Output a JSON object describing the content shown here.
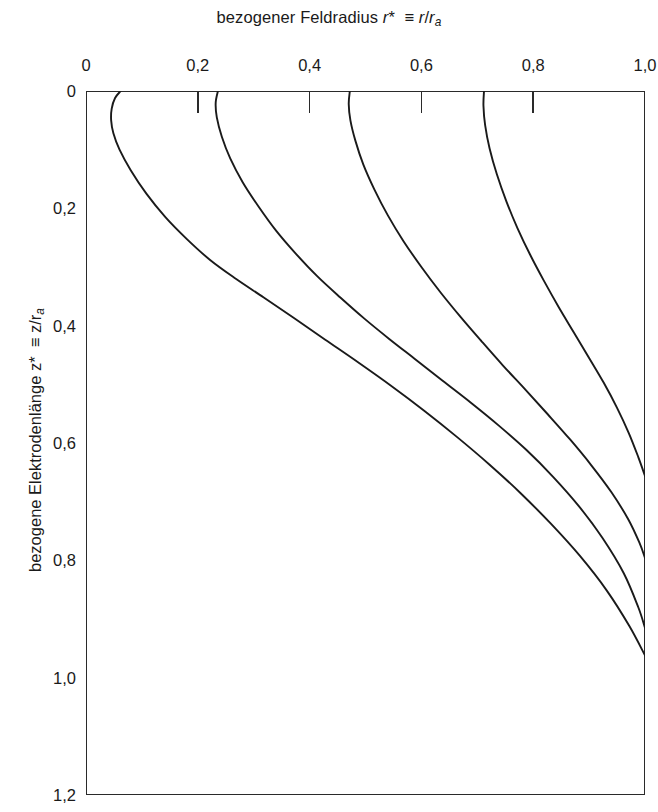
{
  "chart_data": {
    "type": "line",
    "title_plain": "bezogener Feldradius r* ≡ r/ra",
    "title_parts": {
      "text1": "bezogener Feldradius ",
      "sym1": "r",
      "star1": "*",
      "equiv": "≡",
      "sym2": "r",
      "slash": "/",
      "sym3": "r",
      "sub3": "a"
    },
    "ylabel_plain": "bezogene Elektrodenlänge z* ≡ z/ra",
    "ylabel_parts": {
      "text1": "bezogene Elektrodenlänge ",
      "sym1": "z",
      "star1": "*",
      "equiv": "≡",
      "sym2": "z",
      "slash": "/",
      "sym3": "r",
      "sub3": "a"
    },
    "xlabel": "bezogener Feldradius r* ≡ r/ra",
    "ylabel": "bezogene Elektrodenlänge z* ≡ z/ra",
    "xlim": [
      0,
      1.0
    ],
    "ylim": [
      0,
      1.2
    ],
    "y_axis_inverted": true,
    "xticks": [
      0,
      0.2,
      0.4,
      0.6,
      0.8,
      1.0
    ],
    "xtick_labels": [
      "0",
      "0,2",
      "0,4",
      "0,6",
      "0,8",
      "1,0"
    ],
    "yticks": [
      0,
      0.2,
      0.4,
      0.6,
      0.8,
      1.0,
      1.2
    ],
    "ytick_labels": [
      "0",
      "0,2",
      "0,4",
      "0,6",
      "0,8",
      "1,0",
      "1,2"
    ],
    "grid": false,
    "legend": null,
    "line_color": "#1a1a1a",
    "line_width": 1.9,
    "series": [
      {
        "name": "Feldlinie 1",
        "points": [
          [
            0.062,
            0.0
          ],
          [
            0.052,
            0.012
          ],
          [
            0.046,
            0.03
          ],
          [
            0.045,
            0.05
          ],
          [
            0.049,
            0.072
          ],
          [
            0.06,
            0.1
          ],
          [
            0.08,
            0.135
          ],
          [
            0.108,
            0.175
          ],
          [
            0.142,
            0.215
          ],
          [
            0.18,
            0.252
          ],
          [
            0.222,
            0.288
          ],
          [
            0.268,
            0.32
          ],
          [
            0.318,
            0.352
          ],
          [
            0.372,
            0.387
          ],
          [
            0.428,
            0.424
          ],
          [
            0.486,
            0.462
          ],
          [
            0.545,
            0.502
          ],
          [
            0.605,
            0.545
          ],
          [
            0.664,
            0.59
          ],
          [
            0.722,
            0.637
          ],
          [
            0.778,
            0.686
          ],
          [
            0.832,
            0.738
          ],
          [
            0.884,
            0.793
          ],
          [
            0.932,
            0.852
          ],
          [
            0.972,
            0.912
          ],
          [
            1.0,
            0.962
          ]
        ]
      },
      {
        "name": "Feldlinie 2",
        "points": [
          [
            0.236,
            0.0
          ],
          [
            0.232,
            0.02
          ],
          [
            0.234,
            0.045
          ],
          [
            0.243,
            0.078
          ],
          [
            0.258,
            0.115
          ],
          [
            0.28,
            0.155
          ],
          [
            0.308,
            0.196
          ],
          [
            0.34,
            0.238
          ],
          [
            0.376,
            0.278
          ],
          [
            0.414,
            0.316
          ],
          [
            0.455,
            0.352
          ],
          [
            0.498,
            0.388
          ],
          [
            0.543,
            0.423
          ],
          [
            0.59,
            0.458
          ],
          [
            0.638,
            0.494
          ],
          [
            0.688,
            0.531
          ],
          [
            0.738,
            0.57
          ],
          [
            0.788,
            0.612
          ],
          [
            0.836,
            0.658
          ],
          [
            0.882,
            0.708
          ],
          [
            0.924,
            0.762
          ],
          [
            0.962,
            0.822
          ],
          [
            0.988,
            0.88
          ],
          [
            1.0,
            0.915
          ]
        ]
      },
      {
        "name": "Feldlinie 3",
        "points": [
          [
            0.472,
            0.0
          ],
          [
            0.47,
            0.022
          ],
          [
            0.473,
            0.05
          ],
          [
            0.482,
            0.085
          ],
          [
            0.496,
            0.125
          ],
          [
            0.516,
            0.168
          ],
          [
            0.54,
            0.212
          ],
          [
            0.568,
            0.256
          ],
          [
            0.6,
            0.3
          ],
          [
            0.634,
            0.343
          ],
          [
            0.67,
            0.385
          ],
          [
            0.708,
            0.427
          ],
          [
            0.746,
            0.468
          ],
          [
            0.786,
            0.509
          ],
          [
            0.826,
            0.551
          ],
          [
            0.866,
            0.594
          ],
          [
            0.904,
            0.638
          ],
          [
            0.94,
            0.684
          ],
          [
            0.97,
            0.73
          ],
          [
            0.99,
            0.77
          ],
          [
            1.0,
            0.796
          ]
        ]
      },
      {
        "name": "Feldlinie 4",
        "points": [
          [
            0.712,
            0.0
          ],
          [
            0.711,
            0.025
          ],
          [
            0.714,
            0.058
          ],
          [
            0.722,
            0.098
          ],
          [
            0.735,
            0.142
          ],
          [
            0.752,
            0.188
          ],
          [
            0.772,
            0.234
          ],
          [
            0.795,
            0.28
          ],
          [
            0.82,
            0.325
          ],
          [
            0.846,
            0.369
          ],
          [
            0.873,
            0.412
          ],
          [
            0.9,
            0.455
          ],
          [
            0.926,
            0.497
          ],
          [
            0.95,
            0.54
          ],
          [
            0.971,
            0.583
          ],
          [
            0.988,
            0.624
          ],
          [
            1.0,
            0.656
          ]
        ]
      }
    ]
  }
}
